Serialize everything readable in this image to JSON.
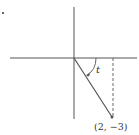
{
  "diagram": {
    "type": "unit-angle-diagram",
    "axes": {
      "origin_px": [
        74,
        58
      ],
      "x_axis": {
        "from_px": [
          10,
          58
        ],
        "to_px": [
          137,
          58
        ]
      },
      "y_axis": {
        "from_px": [
          74,
          7
        ],
        "to_px": [
          74,
          119
        ]
      }
    },
    "ray": {
      "from_px": [
        74,
        58
      ],
      "to_px": [
        112,
        117
      ]
    },
    "dashed_drop": {
      "from_px": [
        113,
        58
      ],
      "to_px": [
        113,
        117
      ]
    },
    "angle": {
      "label": "t",
      "direction": "clockwise"
    },
    "point": {
      "label": "(2, −3)",
      "x": 2,
      "y": -3
    },
    "stray_mark": {
      "px": [
        3,
        13
      ]
    },
    "colors": {
      "axis": "#555555",
      "ray": "#555555",
      "dash": "#666666",
      "text": "#333333",
      "background": "#ffffff"
    }
  }
}
